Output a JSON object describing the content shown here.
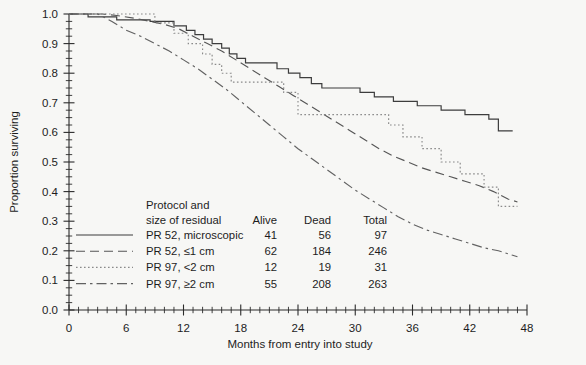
{
  "chart_data": {
    "type": "line",
    "title": "",
    "xlabel": "Months from entry into study",
    "ylabel": "Proportion surviving",
    "xlim": [
      0,
      48
    ],
    "ylim": [
      0.0,
      1.0
    ],
    "x_ticks": [
      0,
      6,
      12,
      18,
      24,
      30,
      36,
      42,
      48
    ],
    "x_tick_labels": [
      "0",
      "6",
      "12",
      "18",
      "24",
      "30",
      "36",
      "42",
      "48"
    ],
    "x_minor_step": 1,
    "y_ticks": [
      0.0,
      0.1,
      0.2,
      0.3,
      0.4,
      0.5,
      0.6,
      0.7,
      0.8,
      0.9,
      1.0
    ],
    "y_tick_labels": [
      "0.0",
      "0.1",
      "0.2",
      "0.3",
      "0.4",
      "0.5",
      "0.6",
      "0.7",
      "0.8",
      "0.9",
      "1.0"
    ],
    "y_minor_step": 0.025,
    "grid": false,
    "legend_position": "lower-left-inside",
    "series": [
      {
        "name": "PR 52, microscopic",
        "style": "solid",
        "color": "#3d3d3d",
        "alive": 41,
        "dead": 56,
        "total": 97,
        "step": true,
        "points": [
          [
            0,
            1.0
          ],
          [
            2.0,
            1.0
          ],
          [
            2.0,
            0.99
          ],
          [
            5.0,
            0.99
          ],
          [
            5.0,
            0.98
          ],
          [
            8.5,
            0.98
          ],
          [
            8.5,
            0.975
          ],
          [
            11.0,
            0.975
          ],
          [
            11.0,
            0.96
          ],
          [
            12.3,
            0.96
          ],
          [
            12.3,
            0.945
          ],
          [
            13.2,
            0.945
          ],
          [
            13.2,
            0.93
          ],
          [
            14.1,
            0.93
          ],
          [
            14.1,
            0.915
          ],
          [
            15.0,
            0.915
          ],
          [
            15.0,
            0.9
          ],
          [
            16.0,
            0.9
          ],
          [
            16.0,
            0.885
          ],
          [
            16.8,
            0.885
          ],
          [
            16.8,
            0.865
          ],
          [
            17.6,
            0.865
          ],
          [
            17.6,
            0.85
          ],
          [
            18.5,
            0.85
          ],
          [
            18.5,
            0.835
          ],
          [
            21.8,
            0.835
          ],
          [
            21.8,
            0.815
          ],
          [
            23.0,
            0.815
          ],
          [
            23.0,
            0.8
          ],
          [
            24.2,
            0.8
          ],
          [
            24.2,
            0.785
          ],
          [
            25.4,
            0.785
          ],
          [
            25.4,
            0.765
          ],
          [
            26.5,
            0.765
          ],
          [
            26.5,
            0.75
          ],
          [
            30.5,
            0.75
          ],
          [
            30.5,
            0.735
          ],
          [
            32.0,
            0.735
          ],
          [
            32.0,
            0.72
          ],
          [
            34.0,
            0.72
          ],
          [
            34.0,
            0.705
          ],
          [
            36.5,
            0.705
          ],
          [
            36.5,
            0.69
          ],
          [
            39.0,
            0.69
          ],
          [
            39.0,
            0.675
          ],
          [
            41.5,
            0.675
          ],
          [
            41.5,
            0.66
          ],
          [
            44.0,
            0.66
          ],
          [
            44.0,
            0.645
          ],
          [
            45.0,
            0.645
          ],
          [
            45.0,
            0.605
          ],
          [
            46.5,
            0.605
          ]
        ]
      },
      {
        "name": "PR 52, ≤1 cm",
        "style": "dashed",
        "color": "#565656",
        "alive": 62,
        "dead": 184,
        "total": 246,
        "step": false,
        "points": [
          [
            0,
            1.0
          ],
          [
            3.5,
            1.0
          ],
          [
            5.0,
            0.995
          ],
          [
            7.0,
            0.985
          ],
          [
            8.5,
            0.975
          ],
          [
            10.0,
            0.965
          ],
          [
            11.5,
            0.95
          ],
          [
            13.0,
            0.925
          ],
          [
            14.5,
            0.9
          ],
          [
            16.0,
            0.875
          ],
          [
            17.5,
            0.845
          ],
          [
            19.0,
            0.815
          ],
          [
            20.5,
            0.785
          ],
          [
            22.0,
            0.755
          ],
          [
            23.5,
            0.725
          ],
          [
            25.0,
            0.695
          ],
          [
            26.5,
            0.665
          ],
          [
            28.0,
            0.635
          ],
          [
            29.5,
            0.605
          ],
          [
            31.0,
            0.575
          ],
          [
            32.5,
            0.545
          ],
          [
            34.0,
            0.52
          ],
          [
            35.5,
            0.5
          ],
          [
            37.0,
            0.48
          ],
          [
            38.5,
            0.465
          ],
          [
            40.0,
            0.45
          ],
          [
            41.5,
            0.435
          ],
          [
            43.0,
            0.42
          ],
          [
            44.5,
            0.4
          ],
          [
            46.0,
            0.375
          ],
          [
            47.0,
            0.365
          ]
        ]
      },
      {
        "name": "PR 97, <2 cm",
        "style": "dotted",
        "color": "#8a8a8a",
        "alive": 12,
        "dead": 19,
        "total": 31,
        "step": true,
        "points": [
          [
            0,
            1.0
          ],
          [
            9.0,
            1.0
          ],
          [
            9.0,
            0.97
          ],
          [
            11.0,
            0.97
          ],
          [
            11.0,
            0.935
          ],
          [
            12.5,
            0.935
          ],
          [
            12.5,
            0.9
          ],
          [
            14.0,
            0.9
          ],
          [
            14.0,
            0.865
          ],
          [
            15.0,
            0.865
          ],
          [
            15.0,
            0.83
          ],
          [
            16.0,
            0.83
          ],
          [
            16.0,
            0.8
          ],
          [
            17.0,
            0.8
          ],
          [
            17.0,
            0.77
          ],
          [
            22.5,
            0.77
          ],
          [
            22.5,
            0.735
          ],
          [
            24.0,
            0.735
          ],
          [
            24.0,
            0.66
          ],
          [
            33.5,
            0.66
          ],
          [
            33.5,
            0.625
          ],
          [
            35.0,
            0.625
          ],
          [
            35.0,
            0.585
          ],
          [
            37.0,
            0.585
          ],
          [
            37.0,
            0.545
          ],
          [
            39.0,
            0.545
          ],
          [
            39.0,
            0.5
          ],
          [
            41.0,
            0.5
          ],
          [
            41.0,
            0.46
          ],
          [
            43.5,
            0.46
          ],
          [
            43.5,
            0.415
          ],
          [
            45.0,
            0.415
          ],
          [
            45.0,
            0.35
          ],
          [
            47.0,
            0.35
          ]
        ]
      },
      {
        "name": "PR 97, ≥2 cm",
        "style": "dashdot",
        "color": "#626262",
        "alive": 55,
        "dead": 208,
        "total": 263,
        "step": false,
        "points": [
          [
            0,
            1.0
          ],
          [
            3.0,
            1.0
          ],
          [
            4.5,
            0.975
          ],
          [
            6.0,
            0.945
          ],
          [
            7.5,
            0.925
          ],
          [
            9.0,
            0.9
          ],
          [
            10.5,
            0.875
          ],
          [
            12.0,
            0.845
          ],
          [
            13.5,
            0.815
          ],
          [
            15.0,
            0.78
          ],
          [
            16.5,
            0.745
          ],
          [
            18.0,
            0.705
          ],
          [
            19.5,
            0.665
          ],
          [
            21.0,
            0.625
          ],
          [
            22.5,
            0.585
          ],
          [
            24.0,
            0.545
          ],
          [
            25.5,
            0.51
          ],
          [
            27.0,
            0.475
          ],
          [
            28.5,
            0.44
          ],
          [
            30.0,
            0.405
          ],
          [
            31.5,
            0.375
          ],
          [
            33.0,
            0.345
          ],
          [
            34.5,
            0.315
          ],
          [
            36.0,
            0.29
          ],
          [
            37.5,
            0.27
          ],
          [
            39.0,
            0.255
          ],
          [
            40.5,
            0.24
          ],
          [
            42.0,
            0.225
          ],
          [
            43.5,
            0.21
          ],
          [
            45.0,
            0.2
          ],
          [
            46.5,
            0.185
          ],
          [
            47.0,
            0.18
          ]
        ]
      }
    ]
  },
  "legend": {
    "header_line1": "Protocol and",
    "header_line2": "size of residual",
    "col_alive": "Alive",
    "col_dead": "Dead",
    "col_total": "Total",
    "rows": [
      {
        "label": "PR 52, microscopic",
        "alive": "41",
        "dead": "56",
        "total": "97"
      },
      {
        "label": "PR 52, ≤1 cm",
        "alive": "62",
        "dead": "184",
        "total": "246"
      },
      {
        "label": "PR 97, <2 cm",
        "alive": "12",
        "dead": "19",
        "total": "31"
      },
      {
        "label": "PR 97, ≥2 cm",
        "alive": "55",
        "dead": "208",
        "total": "263"
      }
    ]
  }
}
